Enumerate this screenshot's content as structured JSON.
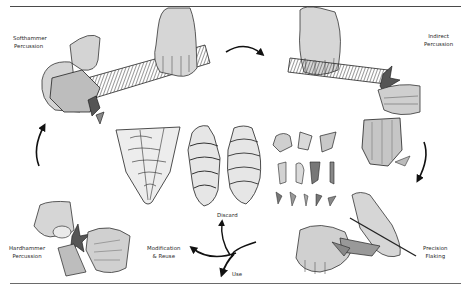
{
  "diagram": {
    "stages": [
      {
        "id": "softhammer",
        "line1": "Softhammer",
        "line2": "Percussion"
      },
      {
        "id": "indirect",
        "line1": "Indirect",
        "line2": "Percussion"
      },
      {
        "id": "precision",
        "line1": "Precision",
        "line2": "Flaking"
      },
      {
        "id": "hardhammer",
        "line1": "Hardhammer",
        "line2": "Percussion"
      }
    ],
    "outcomes": {
      "discard": "Discard",
      "modification_line1": "Modification",
      "modification_line2": "& Reuse",
      "use": "Use"
    },
    "center_items": {
      "cores": [
        "cone-core",
        "cylindrical-core",
        "rounded-core"
      ],
      "flakes_rows": [
        3,
        4,
        5
      ]
    },
    "colors": {
      "ink": "#1e1e1e",
      "skin": "#d8d8d8",
      "stone": "#b8b8b8",
      "rule": "#4a4a4a"
    }
  }
}
